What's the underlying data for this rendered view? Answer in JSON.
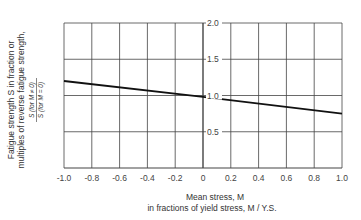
{
  "chart_data": {
    "type": "line",
    "title": "",
    "xlabel_line1": "Mean stress, M",
    "xlabel_line2": "in fractions of yield stress, M / Y.S.",
    "ylabel_line1": "Fatigue strength S in fraction or",
    "ylabel_line2": "multiples of reverse fatigue strength,",
    "ylabel_formula_num": "S (for M ≠ 0)",
    "ylabel_formula_den": "S (for M = 0)",
    "xlim": [
      -1.0,
      1.0
    ],
    "ylim": [
      0,
      2.0
    ],
    "x_ticks": [
      "-1.0",
      "-0.8",
      "-0.6",
      "-0.4",
      "-0.2",
      "0",
      "0.2",
      "0.4",
      "0.6",
      "0.8",
      "1.0"
    ],
    "y_ticks": [
      "0.5",
      "1.0",
      "1.5",
      "2.0"
    ],
    "grid": true,
    "series": [
      {
        "name": "Fatigue strength ratio",
        "x": [
          -1.0,
          0.0,
          1.0
        ],
        "y": [
          1.2,
          0.98,
          0.75
        ]
      }
    ]
  }
}
